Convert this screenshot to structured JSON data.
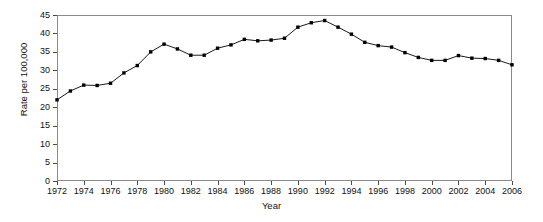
{
  "chart_data": {
    "type": "line",
    "title": "",
    "xlabel": "Year",
    "ylabel": "Rate per 100,000",
    "xlim": [
      1972,
      2006
    ],
    "ylim": [
      0,
      45
    ],
    "ytick_values": [
      0,
      5,
      10,
      15,
      20,
      25,
      30,
      35,
      40,
      45
    ],
    "ytick_labels": [
      "0",
      "5",
      "10",
      "15",
      "20",
      "25",
      "30",
      "35",
      "40",
      "45"
    ],
    "xtick_values": [
      1972,
      1974,
      1976,
      1978,
      1980,
      1982,
      1984,
      1986,
      1988,
      1990,
      1992,
      1994,
      1996,
      1998,
      2000,
      2002,
      2004,
      2006
    ],
    "xtick_labels": [
      "1972",
      "1974",
      "1976",
      "1978",
      "1980",
      "1982",
      "1984",
      "1986",
      "1988",
      "1990",
      "1992",
      "1994",
      "1996",
      "1998",
      "2000",
      "2002",
      "2004",
      "2006"
    ],
    "grid": false,
    "legend": false,
    "marker": "filled-square",
    "line_color": "#1a1a1a",
    "marker_color": "#000000",
    "x": [
      1972,
      1973,
      1974,
      1975,
      1976,
      1977,
      1978,
      1979,
      1980,
      1981,
      1982,
      1983,
      1984,
      1985,
      1986,
      1987,
      1988,
      1989,
      1990,
      1991,
      1992,
      1993,
      1994,
      1995,
      1996,
      1997,
      1998,
      1999,
      2000,
      2001,
      2002,
      2003,
      2004,
      2005,
      2006
    ],
    "values": [
      22.0,
      24.4,
      26.0,
      25.9,
      26.5,
      29.3,
      31.3,
      35.0,
      37.1,
      35.8,
      34.1,
      34.1,
      36.0,
      36.9,
      38.4,
      38.0,
      38.2,
      38.7,
      41.7,
      42.9,
      43.5,
      41.7,
      39.8,
      37.6,
      36.7,
      36.3,
      34.8,
      33.5,
      32.7,
      32.7,
      34.0,
      33.3,
      33.2,
      32.7,
      31.5
    ],
    "series": [
      {
        "name": "Rate per 100,000",
        "values": [
          22.0,
          24.4,
          26.0,
          25.9,
          26.5,
          29.3,
          31.3,
          35.0,
          37.1,
          35.8,
          34.1,
          34.1,
          36.0,
          36.9,
          38.4,
          38.0,
          38.2,
          38.7,
          41.7,
          42.9,
          43.5,
          41.7,
          39.8,
          37.6,
          36.7,
          36.3,
          34.8,
          33.5,
          32.7,
          32.7,
          34.0,
          33.3,
          33.2,
          32.7,
          31.5
        ]
      }
    ]
  }
}
